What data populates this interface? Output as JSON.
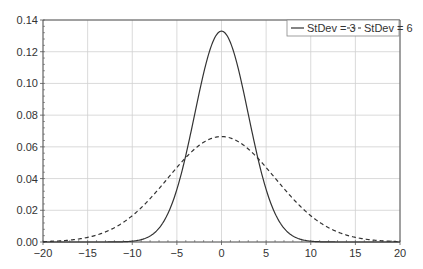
{
  "chart_data": {
    "type": "line",
    "title": "",
    "xlabel": "",
    "ylabel": "",
    "xlim": [
      -20,
      20
    ],
    "ylim": [
      0,
      0.14
    ],
    "x_ticks": [
      "-20",
      "-15",
      "-10",
      "-5",
      "0",
      "5",
      "10",
      "15",
      "20"
    ],
    "x_tick_values": [
      -20,
      -15,
      -10,
      -5,
      0,
      5,
      10,
      15,
      20
    ],
    "y_ticks": [
      "0.00",
      "0.02",
      "0.04",
      "0.06",
      "0.08",
      "0.10",
      "0.12",
      "0.14"
    ],
    "y_tick_values": [
      0,
      0.02,
      0.04,
      0.06,
      0.08,
      0.1,
      0.12,
      0.14
    ],
    "grid": true,
    "legend_position": "upper right",
    "series": [
      {
        "name": "StDev = 3",
        "style": "solid",
        "mean": 0,
        "stdev": 3,
        "x": [
          -20,
          -15,
          -10,
          -8,
          -6,
          -5,
          -4,
          -3,
          -2,
          -1,
          0,
          1,
          2,
          3,
          4,
          5,
          6,
          8,
          10,
          15,
          20
        ],
        "values": [
          0.0,
          0.0,
          0.0005,
          0.0038,
          0.018,
          0.0332,
          0.0547,
          0.0807,
          0.1065,
          0.1258,
          0.133,
          0.1258,
          0.1065,
          0.0807,
          0.0547,
          0.0332,
          0.018,
          0.0038,
          0.0005,
          0.0,
          0.0
        ]
      },
      {
        "name": "StDev = 6",
        "style": "dashed",
        "mean": 0,
        "stdev": 6,
        "x": [
          -20,
          -15,
          -10,
          -8,
          -6,
          -5,
          -4,
          -3,
          -2,
          -1,
          0,
          1,
          2,
          3,
          4,
          5,
          6,
          8,
          10,
          15,
          20
        ],
        "values": [
          0.0003,
          0.0029,
          0.0166,
          0.0273,
          0.0403,
          0.047,
          0.0532,
          0.0587,
          0.0629,
          0.0656,
          0.0665,
          0.0656,
          0.0629,
          0.0587,
          0.0532,
          0.047,
          0.0403,
          0.0273,
          0.0166,
          0.0029,
          0.0003
        ]
      }
    ]
  },
  "legend": {
    "items": [
      {
        "label": "StDev = 3",
        "style": "solid"
      },
      {
        "label": "StDev = 6",
        "style": "dashed"
      }
    ]
  },
  "colors": {
    "line": "#333333",
    "grid": "#d0d0d0",
    "axis": "#555555"
  }
}
